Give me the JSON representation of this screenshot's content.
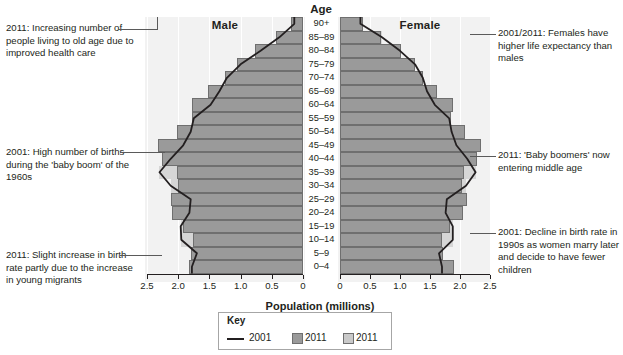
{
  "title_age": "Age",
  "labels": {
    "male": "Male",
    "female": "Female",
    "x_title": "Population (millions)"
  },
  "key": {
    "title": "Key",
    "items": [
      {
        "label": "2001",
        "marker": "line",
        "color": "#231f20"
      },
      {
        "label": "2011",
        "marker": "swatch",
        "color": "#9a9a9a"
      },
      {
        "label": "2011",
        "marker": "swatch",
        "color": "#c9c9c9"
      }
    ]
  },
  "annotations": {
    "left": [
      {
        "id": "anno-old-age",
        "text": "2011: Increasing number of people living to old age due to improved health care"
      },
      {
        "id": "anno-baby-boom",
        "text": "2001: High number of births during the 'baby boom' of the 1960s"
      },
      {
        "id": "anno-migrants",
        "text": "2011: Slight increase in birth rate partly due to the increase in young migrants"
      }
    ],
    "right": [
      {
        "id": "anno-life-expectancy",
        "text": "2001/2011: Females have higher life expectancy than males"
      },
      {
        "id": "anno-boomers-middle-age",
        "text": "2011: 'Baby boomers' now entering middle age"
      },
      {
        "id": "anno-birth-decline",
        "text": "2001: Decline in birth rate in 1990s as women marry later and decide to have fewer children"
      }
    ]
  },
  "chart_data": {
    "type": "bar",
    "subtype": "population-pyramid",
    "title": "Age",
    "xlabel": "Population (millions)",
    "ylabel": "Age",
    "xlim": [
      0,
      2.5
    ],
    "grid": true,
    "legend_position": "bottom-center",
    "x_tick_labels_male": [
      "2.5",
      "2.0",
      "1.5",
      "1.0",
      "0.5",
      "0"
    ],
    "x_tick_labels_female": [
      "0",
      "0.5",
      "1.0",
      "1.5",
      "2.0",
      "2.5"
    ],
    "x_tick_values": [
      2.5,
      2.0,
      1.5,
      1.0,
      0.5,
      0
    ],
    "categories": [
      "0–4",
      "5–9",
      "10–14",
      "15–19",
      "20–24",
      "25–29",
      "30–34",
      "35–39",
      "40–44",
      "45–49",
      "50–54",
      "55–59",
      "60–64",
      "65–69",
      "70–74",
      "75–79",
      "80–84",
      "85–89",
      "90+"
    ],
    "series": [
      {
        "name": "2011",
        "side": "male",
        "color": "#9a9a9a",
        "values": [
          1.83,
          1.8,
          1.77,
          1.92,
          2.1,
          2.12,
          2.0,
          2.02,
          2.26,
          2.32,
          2.02,
          1.78,
          1.78,
          1.52,
          1.25,
          1.05,
          0.77,
          0.44,
          0.2
        ]
      },
      {
        "name": "2001",
        "side": "male",
        "color": "#231f20",
        "values": [
          1.78,
          1.7,
          1.95,
          1.96,
          1.82,
          1.8,
          2.12,
          2.3,
          2.12,
          1.92,
          1.8,
          1.75,
          1.48,
          1.34,
          1.22,
          1.0,
          0.68,
          0.38,
          0.14
        ]
      },
      {
        "name": "2011",
        "side": "female",
        "color": "#9a9a9a",
        "values": [
          1.9,
          1.72,
          1.7,
          1.83,
          2.05,
          2.12,
          2.04,
          2.06,
          2.28,
          2.35,
          2.08,
          1.85,
          1.88,
          1.62,
          1.38,
          1.25,
          1.02,
          0.68,
          0.38
        ]
      },
      {
        "name": "2001",
        "side": "female",
        "color": "#231f20",
        "values": [
          1.7,
          1.65,
          1.88,
          1.88,
          1.76,
          1.78,
          2.1,
          2.26,
          2.12,
          1.94,
          1.86,
          1.82,
          1.58,
          1.45,
          1.38,
          1.25,
          1.0,
          0.7,
          0.34
        ]
      }
    ]
  }
}
